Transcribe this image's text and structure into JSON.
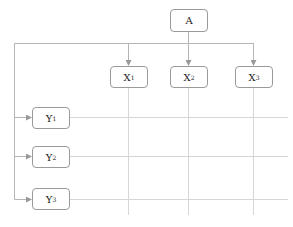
{
  "diagram": {
    "root": {
      "label": "A"
    },
    "columns": [
      {
        "label": "X",
        "sub": "1"
      },
      {
        "label": "X",
        "sub": "2"
      },
      {
        "label": "X",
        "sub": "3"
      }
    ],
    "rows": [
      {
        "label": "Y",
        "sub": "1"
      },
      {
        "label": "Y",
        "sub": "2"
      },
      {
        "label": "Y",
        "sub": "3"
      }
    ],
    "edges": [
      {
        "from": "A",
        "to": "X1"
      },
      {
        "from": "A",
        "to": "X2"
      },
      {
        "from": "A",
        "to": "X3"
      },
      {
        "from": "A",
        "to": "Y1"
      },
      {
        "from": "A",
        "to": "Y2"
      },
      {
        "from": "A",
        "to": "Y3"
      }
    ],
    "colors": {
      "line": "#b5b5b5",
      "border": "#9a9a9a"
    }
  }
}
